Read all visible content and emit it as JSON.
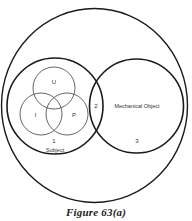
{
  "figure": {
    "caption": "Figure 63(a)"
  },
  "diagram": {
    "outer_circle": {
      "label": ""
    },
    "subject_circle": {
      "label": "Subject",
      "region_number": "1",
      "inner_circles": [
        {
          "label": "U"
        },
        {
          "label": "I"
        },
        {
          "label": "P"
        }
      ]
    },
    "intersection": {
      "region_number": "2"
    },
    "object_circle": {
      "label": "Mechanical Object",
      "region_number": "3"
    }
  },
  "colors": {
    "stroke_dark": "#1a1a1a",
    "stroke_light": "#555555",
    "background": "#ffffff"
  }
}
